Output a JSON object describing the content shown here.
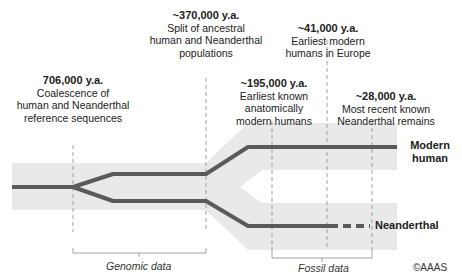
{
  "events": [
    {
      "date": "706,000 y.a.",
      "line1": "Coalescence of",
      "line2": "human and Neanderthal",
      "line3": "reference sequences"
    },
    {
      "date": "~370,000 y.a.",
      "line1": "Split of ancestral",
      "line2": "human and Neanderthal",
      "line3": "populations"
    },
    {
      "date": "~195,000 y.a.",
      "line1": "Earliest known",
      "line2": "anatomically",
      "line3": "modern humans"
    },
    {
      "date": "~41,000 y.a.",
      "line1": "Earliest modern",
      "line2": "humans in Europe",
      "line3": ""
    },
    {
      "date": "~28,000 y.a.",
      "line1": "Most recent known",
      "line2": "Neanderthal remains",
      "line3": ""
    }
  ],
  "lineages": {
    "modern_line1": "Modern",
    "modern_line2": "human",
    "neanderthal": "Neanderthal"
  },
  "ranges": {
    "genomic": "Genomic data",
    "fossil": "Fossil data"
  },
  "credit": "©AAAS",
  "colors": {
    "line": "#5a5a5a",
    "band": "#e8e8e8",
    "guide": "#8a8a8a"
  }
}
